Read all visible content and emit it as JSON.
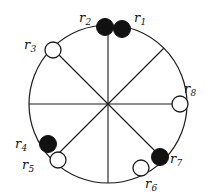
{
  "figure": {
    "kind": "circle-diagram",
    "background_color": "#ffffff",
    "stroke_color": "#1a1a1a",
    "filled_node_color": "#111111",
    "open_node_fill": "#ffffff",
    "circle": {
      "cx": 108,
      "cy": 104,
      "r": 79,
      "stroke_width": 1.2
    },
    "spokes": [
      {
        "name": "spoke-horizontal",
        "x1": 29,
        "y1": 104,
        "x2": 187,
        "y2": 104
      },
      {
        "name": "spoke-vertical",
        "x1": 108,
        "y1": 25,
        "x2": 108,
        "y2": 183
      },
      {
        "name": "spoke-diagonal-nw-se",
        "x1": 52,
        "y1": 48,
        "x2": 164,
        "y2": 160
      },
      {
        "name": "spoke-diagonal-ne-sw",
        "x1": 164,
        "y1": 48,
        "x2": 52,
        "y2": 160
      }
    ],
    "nodes": [
      {
        "id": "r1",
        "letter": "r",
        "index": "1",
        "cx": 122,
        "cy": 29,
        "radius": 8.5,
        "filled": true,
        "label_x": 134,
        "label_y": 11
      },
      {
        "id": "r2",
        "letter": "r",
        "index": "2",
        "cx": 105,
        "cy": 27,
        "radius": 8.5,
        "filled": true,
        "label_x": 79,
        "label_y": 11
      },
      {
        "id": "r3",
        "letter": "r",
        "index": "3",
        "cx": 53,
        "cy": 50,
        "radius": 8.0,
        "filled": false,
        "label_x": 24,
        "label_y": 38
      },
      {
        "id": "r4",
        "letter": "r",
        "index": "4",
        "cx": 48,
        "cy": 144,
        "radius": 8.5,
        "filled": true,
        "label_x": 15,
        "label_y": 137
      },
      {
        "id": "r5",
        "letter": "r",
        "index": "5",
        "cx": 58,
        "cy": 160,
        "radius": 8.0,
        "filled": false,
        "label_x": 22,
        "label_y": 158
      },
      {
        "id": "r6",
        "letter": "r",
        "index": "6",
        "cx": 141,
        "cy": 168,
        "radius": 8.0,
        "filled": false,
        "label_x": 145,
        "label_y": 177
      },
      {
        "id": "r7",
        "letter": "r",
        "index": "7",
        "cx": 160,
        "cy": 157,
        "radius": 8.5,
        "filled": true,
        "label_x": 170,
        "label_y": 152
      },
      {
        "id": "r8",
        "letter": "r",
        "index": "8",
        "cx": 180,
        "cy": 104,
        "radius": 8.0,
        "filled": false,
        "label_x": 184,
        "label_y": 82
      }
    ]
  }
}
